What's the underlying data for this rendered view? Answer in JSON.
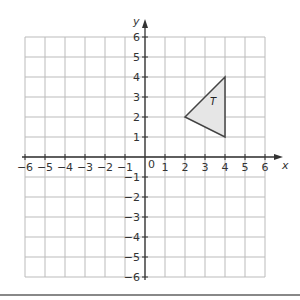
{
  "diagram": {
    "type": "coordinate-grid",
    "x_axis": {
      "label": "x",
      "min": -6,
      "max": 6,
      "ticks": [
        "-6",
        "-5",
        "-4",
        "-3",
        "-2",
        "-1",
        "1",
        "2",
        "3",
        "4",
        "5",
        "6"
      ]
    },
    "y_axis": {
      "label": "y",
      "min": -6,
      "max": 6,
      "ticks": [
        "6",
        "5",
        "4",
        "3",
        "2",
        "1",
        "-1",
        "-2",
        "-3",
        "-4",
        "-5",
        "-6"
      ]
    },
    "origin_label": "0",
    "shape": {
      "name": "T",
      "vertices": [
        [
          2,
          2
        ],
        [
          4,
          4
        ],
        [
          4,
          1
        ]
      ],
      "fill": "#e6e6e6",
      "stroke": "#444444"
    },
    "grid_color": "#bbbbbb",
    "axis_color": "#333333"
  }
}
